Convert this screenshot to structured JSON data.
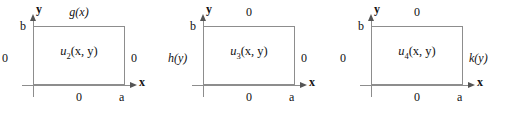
{
  "figure": {
    "type": "boundary-value-problem-diagram",
    "axis_color": "#8d8d8d",
    "text_color": "#111111",
    "axes": {
      "x_label": "x",
      "y_label": "y",
      "x_tick_label": "a",
      "y_tick_label": "b"
    }
  },
  "panels": [
    {
      "id": "panel-u2",
      "interior": {
        "symbol": "u",
        "subscript": "2",
        "args": "(x, y)"
      },
      "boundary": {
        "top": "g(x)",
        "bottom": "0",
        "left": "0",
        "right": "0"
      },
      "top_is_function": true,
      "left_is_function": false,
      "right_is_function": false,
      "axes": {
        "x_label": "x",
        "y_label": "y",
        "x_tick_label": "a",
        "y_tick_label": "b"
      }
    },
    {
      "id": "panel-u3",
      "interior": {
        "symbol": "u",
        "subscript": "3",
        "args": "(x, y)"
      },
      "boundary": {
        "top": "0",
        "bottom": "0",
        "left": "h(y)",
        "right": "0"
      },
      "top_is_function": false,
      "left_is_function": true,
      "right_is_function": false,
      "axes": {
        "x_label": "x",
        "y_label": "y",
        "x_tick_label": "a",
        "y_tick_label": "b"
      }
    },
    {
      "id": "panel-u4",
      "interior": {
        "symbol": "u",
        "subscript": "4",
        "args": "(x, y)"
      },
      "boundary": {
        "top": "0",
        "bottom": "0",
        "left": "0",
        "right": "k(y)"
      },
      "top_is_function": false,
      "left_is_function": false,
      "right_is_function": true,
      "axes": {
        "x_label": "x",
        "y_label": "y",
        "x_tick_label": "a",
        "y_tick_label": "b"
      }
    }
  ]
}
